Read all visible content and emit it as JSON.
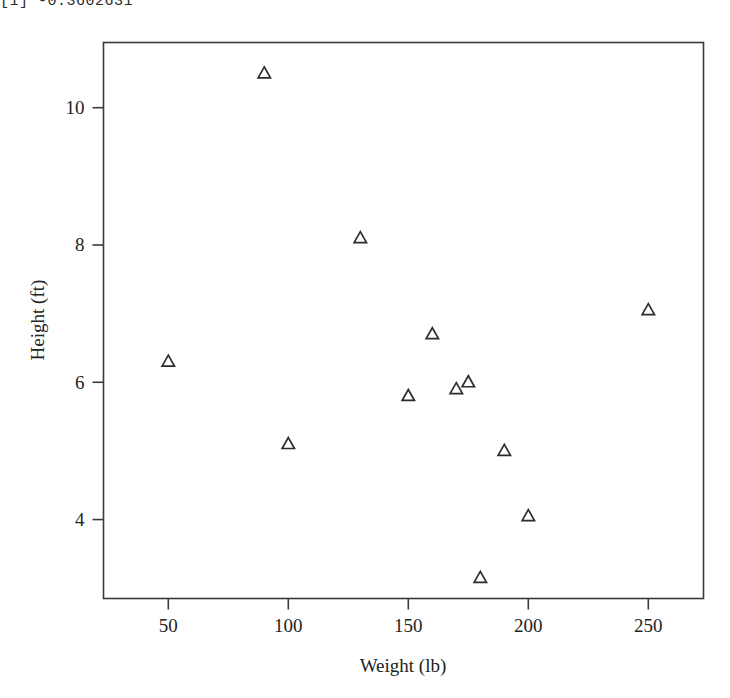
{
  "console": {
    "top_line": "[1] -0.3602631",
    "bottom_line": ""
  },
  "chart_data": {
    "type": "scatter",
    "title": "",
    "subtitle": "",
    "xlabel": "Weight (lb)",
    "ylabel": "Height (ft)",
    "xlim": [
      23,
      273
    ],
    "ylim": [
      2.85,
      10.95
    ],
    "xticks": [
      50,
      100,
      150,
      200,
      250
    ],
    "yticks": [
      4,
      6,
      8,
      10
    ],
    "xtick_labels": [
      "50",
      "100",
      "150",
      "200",
      "250"
    ],
    "ytick_labels": [
      "4",
      "6",
      "8",
      "10"
    ],
    "grid": false,
    "legend": null,
    "legend_position": "none",
    "marker": "open-triangle",
    "marker_color": "#2d2d2d",
    "box_frame": true,
    "tick_direction": "out",
    "series": [
      {
        "name": "observations",
        "x": [
          50,
          90,
          100,
          130,
          150,
          160,
          170,
          175,
          180,
          190,
          200,
          250
        ],
        "y": [
          6.3,
          10.5,
          5.1,
          8.1,
          5.8,
          6.7,
          5.9,
          6.0,
          3.15,
          5.0,
          4.05,
          7.05
        ]
      }
    ],
    "points": [
      {
        "weight": 50,
        "height": 6.3
      },
      {
        "weight": 90,
        "height": 10.5
      },
      {
        "weight": 100,
        "height": 5.1
      },
      {
        "weight": 130,
        "height": 8.1
      },
      {
        "weight": 150,
        "height": 5.8
      },
      {
        "weight": 160,
        "height": 6.7
      },
      {
        "weight": 170,
        "height": 5.9
      },
      {
        "weight": 175,
        "height": 6.0
      },
      {
        "weight": 180,
        "height": 3.15
      },
      {
        "weight": 190,
        "height": 5.0
      },
      {
        "weight": 200,
        "height": 4.05
      },
      {
        "weight": 250,
        "height": 7.05
      }
    ]
  }
}
